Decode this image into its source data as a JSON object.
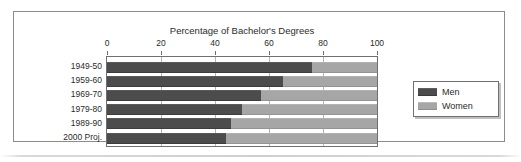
{
  "chart_data": {
    "type": "bar",
    "orientation": "horizontal",
    "stacked": true,
    "stack_total": 100,
    "title": "Percentage of Bachelor's Degrees",
    "xlabel": "",
    "ylabel": "",
    "xlim": [
      0,
      100
    ],
    "xticks": [
      0,
      20,
      40,
      60,
      80,
      100
    ],
    "xtick_labels": [
      "0",
      "20",
      "40",
      "60",
      "80",
      "100"
    ],
    "grid": true,
    "legend_position": "right",
    "categories": [
      "1949-50",
      "1959-60",
      "1969-70",
      "1979-80",
      "1989-90",
      "2000 Proj."
    ],
    "series": [
      {
        "name": "Men",
        "color": "#4c4c4c",
        "values": [
          76,
          65,
          57,
          50,
          46,
          44
        ]
      },
      {
        "name": "Women",
        "color": "#a6a6a6",
        "values": [
          24,
          35,
          43,
          50,
          54,
          56
        ]
      }
    ]
  },
  "legend": {
    "items": [
      {
        "label": "Men",
        "color": "#4c4c4c"
      },
      {
        "label": "Women",
        "color": "#a6a6a6"
      }
    ]
  },
  "colors": {
    "men": "#4c4c4c",
    "women": "#a6a6a6",
    "frame": "#8c8c8c",
    "axis": "#6f6f6f",
    "gridline": "#b5b5b5",
    "text": "#2b2b2b",
    "background": "#ffffff"
  }
}
